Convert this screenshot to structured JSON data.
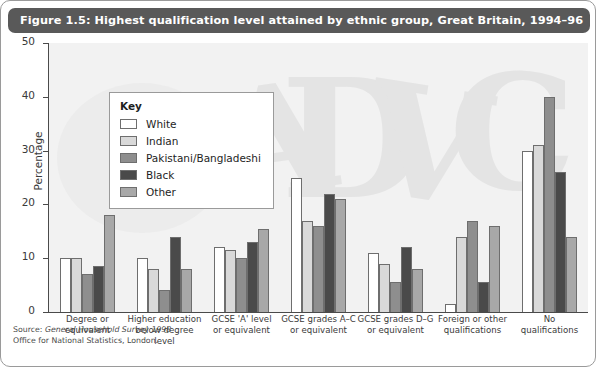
{
  "title": "Figure 1.5: Highest qualification level attained by ethnic group, Great Britain, 1994–96",
  "legend": {
    "title": "Key",
    "items": [
      {
        "label": "White",
        "color": "#ffffff"
      },
      {
        "label": "Indian",
        "color": "#d9d9d9"
      },
      {
        "label": "Pakistani/Bangladeshi",
        "color": "#8e8e8e"
      },
      {
        "label": "Black",
        "color": "#4a4a4a"
      },
      {
        "label": "Other",
        "color": "#a8a8a8"
      }
    ]
  },
  "footer": {
    "source_prefix": "Source: ",
    "source_title": "General Household Survey 1998",
    "office_line": "Office for National Statistics, London."
  },
  "chart_data": {
    "type": "bar",
    "title": "Figure 1.5: Highest qualification level attained by ethnic group, Great Britain, 1994–96",
    "xlabel": "",
    "ylabel": "Percentage",
    "ylim": [
      0,
      50
    ],
    "yticks": [
      0,
      10,
      20,
      30,
      40,
      50
    ],
    "ytick_labels": [
      "0",
      "10",
      "20",
      "30",
      "40",
      "50"
    ],
    "grid": false,
    "legend_position": "upper-left-inside",
    "categories": [
      "Degree or equivalent",
      "Higher education below degree level",
      "GCSE 'A' level or equivalent",
      "GCSE grades A–C or equivalent",
      "GCSE grades D–G or equivalent",
      "Foreign or other qualifications",
      "No qualifications"
    ],
    "category_lines": [
      [
        "Degree or",
        "equivalent"
      ],
      [
        "Higher education",
        "below degree level"
      ],
      [
        "GCSE 'A' level",
        "or equivalent"
      ],
      [
        "GCSE grades A–C",
        "or equivalent"
      ],
      [
        "GCSE grades D–G",
        "or equivalent"
      ],
      [
        "Foreign or other",
        "qualifications"
      ],
      [
        "No",
        "qualifications"
      ]
    ],
    "series": [
      {
        "name": "White",
        "color": "#ffffff",
        "values": [
          10,
          10,
          12,
          25,
          11,
          1.5,
          30
        ]
      },
      {
        "name": "Indian",
        "color": "#d9d9d9",
        "values": [
          10,
          8,
          11.5,
          17,
          9,
          14,
          31
        ]
      },
      {
        "name": "Pakistani/Bangladeshi",
        "color": "#8e8e8e",
        "values": [
          7,
          4,
          10,
          16,
          5.5,
          17,
          40
        ]
      },
      {
        "name": "Black",
        "color": "#4a4a4a",
        "values": [
          8.5,
          14,
          13,
          22,
          12,
          5.5,
          26
        ]
      },
      {
        "name": "Other",
        "color": "#a8a8a8",
        "values": [
          18,
          8,
          15.5,
          21,
          8,
          16,
          14
        ]
      }
    ]
  }
}
